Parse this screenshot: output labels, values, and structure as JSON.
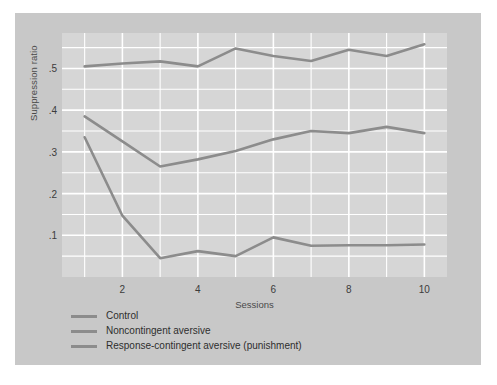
{
  "chart_data": {
    "type": "line",
    "title": "",
    "xlabel": "Sessions",
    "ylabel": "Suppression ratio",
    "x": [
      1,
      2,
      3,
      4,
      5,
      6,
      7,
      8,
      9,
      10
    ],
    "xlim": [
      0.4,
      10.6
    ],
    "ylim": [
      0.0,
      0.585
    ],
    "xticks": [
      "2",
      "4",
      "6",
      "8",
      "10"
    ],
    "xtick_values": [
      2,
      4,
      6,
      8,
      10
    ],
    "yticks": [
      ".5",
      ".4",
      ".3",
      ".2",
      ".1"
    ],
    "ytick_values": [
      0.5,
      0.4,
      0.3,
      0.2,
      0.1
    ],
    "grid": true,
    "legend_position": "below-axes",
    "line_color": "#8c8c8c",
    "plot_bg_color": "#d6d6d6",
    "figure_bg_color": "#c8c8c8",
    "grid_color": "#ffffff",
    "series": [
      {
        "name": "Control",
        "values": [
          0.505,
          0.512,
          0.517,
          0.505,
          0.548,
          0.53,
          0.518,
          0.545,
          0.53,
          0.558
        ]
      },
      {
        "name": "Noncontingent aversive",
        "values": [
          0.385,
          0.325,
          0.265,
          0.282,
          0.302,
          0.33,
          0.35,
          0.345,
          0.36,
          0.345
        ]
      },
      {
        "name": "Response-contingent aversive (punishment)",
        "values": [
          0.335,
          0.147,
          0.045,
          0.062,
          0.05,
          0.095,
          0.075,
          0.076,
          0.076,
          0.078
        ]
      }
    ]
  },
  "axis": {
    "y_title": "Suppression ratio",
    "x_title": "Sessions"
  },
  "legend": {
    "items": [
      {
        "label": "Control",
        "swatch_color": "#8c8c8c"
      },
      {
        "label": "Noncontingent aversive",
        "swatch_color": "#8c8c8c"
      },
      {
        "label": "Response-contingent aversive (punishment)",
        "swatch_color": "#8c8c8c"
      }
    ]
  }
}
